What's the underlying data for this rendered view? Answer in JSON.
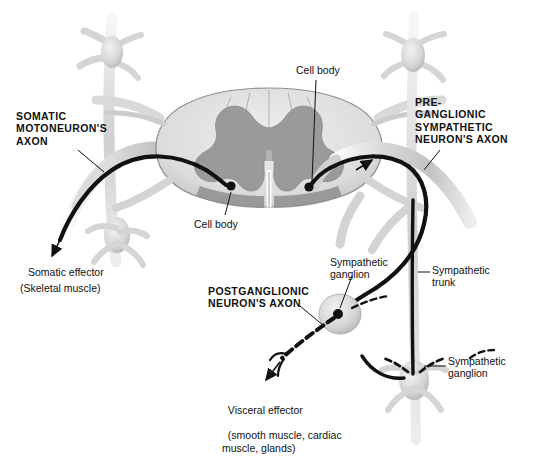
{
  "figure": {
    "background_color": "#ffffff",
    "ink_color": "#111111",
    "white_matter_color": "#e3e3e3",
    "gray_matter_color": "#9a9a9a",
    "nerve_color": "#d8d8d8"
  },
  "labels": {
    "somatic_motoneuron_axon": "SOMATIC\nMOTONEURON'S\nAXON",
    "preganglionic_sympathetic_axon": "PRE-\nGANGLIONIC\nSYMPATHETIC\nNEURON'S AXON",
    "cell_body_top": "Cell body",
    "cell_body_bottom": "Cell body",
    "somatic_effector": "Somatic effector",
    "skeletal_muscle": "(Skeletal muscle)",
    "sympathetic_ganglion_upper": "Sympathetic\nganglion",
    "postganglionic_neuron_axon": "POSTGANGLIONIC\nNEURON'S AXON",
    "sympathetic_trunk": "Sympathetic\ntrunk",
    "sympathetic_ganglion_lower": "Sympathetic\nganglion",
    "visceral_effector": "Visceral effector",
    "visceral_effector_detail": "(smooth muscle, cardiac\nmuscle, glands)"
  },
  "structures": {
    "spinal_cord": "spinal-cord-cross-section",
    "gray_matter": "butterfly-gray-matter",
    "somatic_axon": "solid-black-axon",
    "preganglionic_axon": "solid-black-axon",
    "postganglionic_axon": "dashed-black-axon",
    "ganglion_marker": "oval-with-cell-body-dot"
  }
}
